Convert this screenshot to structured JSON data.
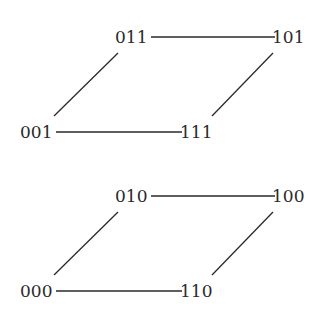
{
  "diagrams": [
    {
      "name": "upper-face",
      "nodes": [
        {
          "id": "011",
          "label": "011",
          "x": 115,
          "y": 43
        },
        {
          "id": "101",
          "label": "101",
          "x": 272,
          "y": 43
        },
        {
          "id": "001",
          "label": "001",
          "x": 20,
          "y": 138
        },
        {
          "id": "111",
          "label": "111",
          "x": 180,
          "y": 138
        }
      ],
      "edges": [
        {
          "from": "011",
          "to": "101"
        },
        {
          "from": "001",
          "to": "111"
        },
        {
          "from": "011",
          "to": "001"
        },
        {
          "from": "101",
          "to": "111"
        }
      ]
    },
    {
      "name": "lower-face",
      "nodes": [
        {
          "id": "010",
          "label": "010",
          "x": 115,
          "y": 202
        },
        {
          "id": "100",
          "label": "100",
          "x": 272,
          "y": 202
        },
        {
          "id": "000",
          "label": "000",
          "x": 20,
          "y": 297
        },
        {
          "id": "110",
          "label": "110",
          "x": 180,
          "y": 297
        }
      ],
      "edges": [
        {
          "from": "010",
          "to": "100"
        },
        {
          "from": "000",
          "to": "110"
        },
        {
          "from": "010",
          "to": "000"
        },
        {
          "from": "100",
          "to": "110"
        }
      ]
    }
  ]
}
